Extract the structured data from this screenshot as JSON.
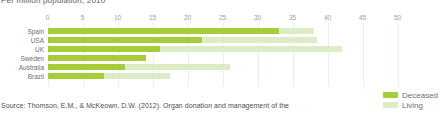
{
  "title": "Per million population, 2010",
  "source": "Source: Thomson, E.M., & McKeown, D.W. (2012). Organ donation and management of the",
  "colors": {
    "deceased": "#a5cd39",
    "living": "#dcecc5",
    "gridline": "#e9f0de",
    "tick_text": "#9b9c9e",
    "label_text": "#6d6e71",
    "title_text": "#58595b",
    "source_text": "#4d4e50"
  },
  "legend": {
    "position": "bottom-right",
    "items": [
      {
        "label": "Deceased",
        "color": "#a5cd39"
      },
      {
        "label": "Living",
        "color": "#dcecc5"
      }
    ]
  },
  "chart_data": {
    "type": "bar",
    "orientation": "horizontal",
    "stacked": true,
    "title": "Per million population, 2010",
    "categories": [
      "Spain",
      "USA",
      "UK",
      "Sweden",
      "Australia",
      "Brazil"
    ],
    "series": [
      {
        "name": "Deceased",
        "color": "#a5cd39",
        "values": [
          33,
          22,
          16,
          14,
          11,
          8
        ]
      },
      {
        "name": "Living",
        "color": "#dcecc5",
        "values": [
          5,
          16.5,
          26,
          0,
          15,
          9.5
        ]
      }
    ],
    "xlim": [
      0,
      50
    ],
    "xticks": [
      0,
      5,
      10,
      15,
      20,
      25,
      30,
      35,
      40,
      45,
      50
    ],
    "grid": true,
    "legend_position": "bottom-right"
  }
}
